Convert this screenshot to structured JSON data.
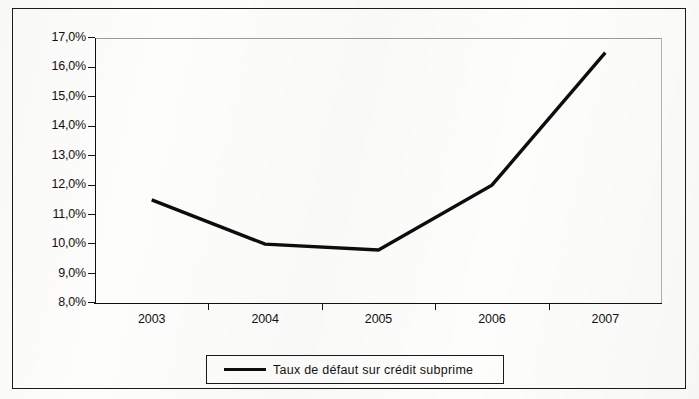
{
  "chart_data": {
    "type": "line",
    "title": "",
    "subtitle": "",
    "xlabel": "",
    "ylabel": "",
    "categories": [
      "2003",
      "2004",
      "2005",
      "2006",
      "2007"
    ],
    "series": [
      {
        "name": "Taux de défaut sur crédit subprime",
        "values": [
          11.5,
          10.0,
          9.8,
          12.0,
          16.5
        ],
        "color": "#0d0d0d"
      }
    ],
    "ylim": [
      8.0,
      17.0
    ],
    "y_ticks": [
      "17,0%",
      "16,0%",
      "15,0%",
      "14,0%",
      "13,0%",
      "12,0%",
      "11,0%",
      "10,0%",
      "9,0%",
      "8,0%"
    ],
    "y_tick_values": [
      17.0,
      16.0,
      15.0,
      14.0,
      13.0,
      12.0,
      11.0,
      10.0,
      9.0,
      8.0
    ],
    "x_ticks": [
      "2003",
      "2004",
      "2005",
      "2006",
      "2007"
    ],
    "grid": false,
    "legend_position": "bottom",
    "legend_entries": [
      "Taux de défaut sur crédit subprime"
    ],
    "annotations": []
  },
  "legend": {
    "label": "Taux de défaut sur crédit subprime"
  }
}
